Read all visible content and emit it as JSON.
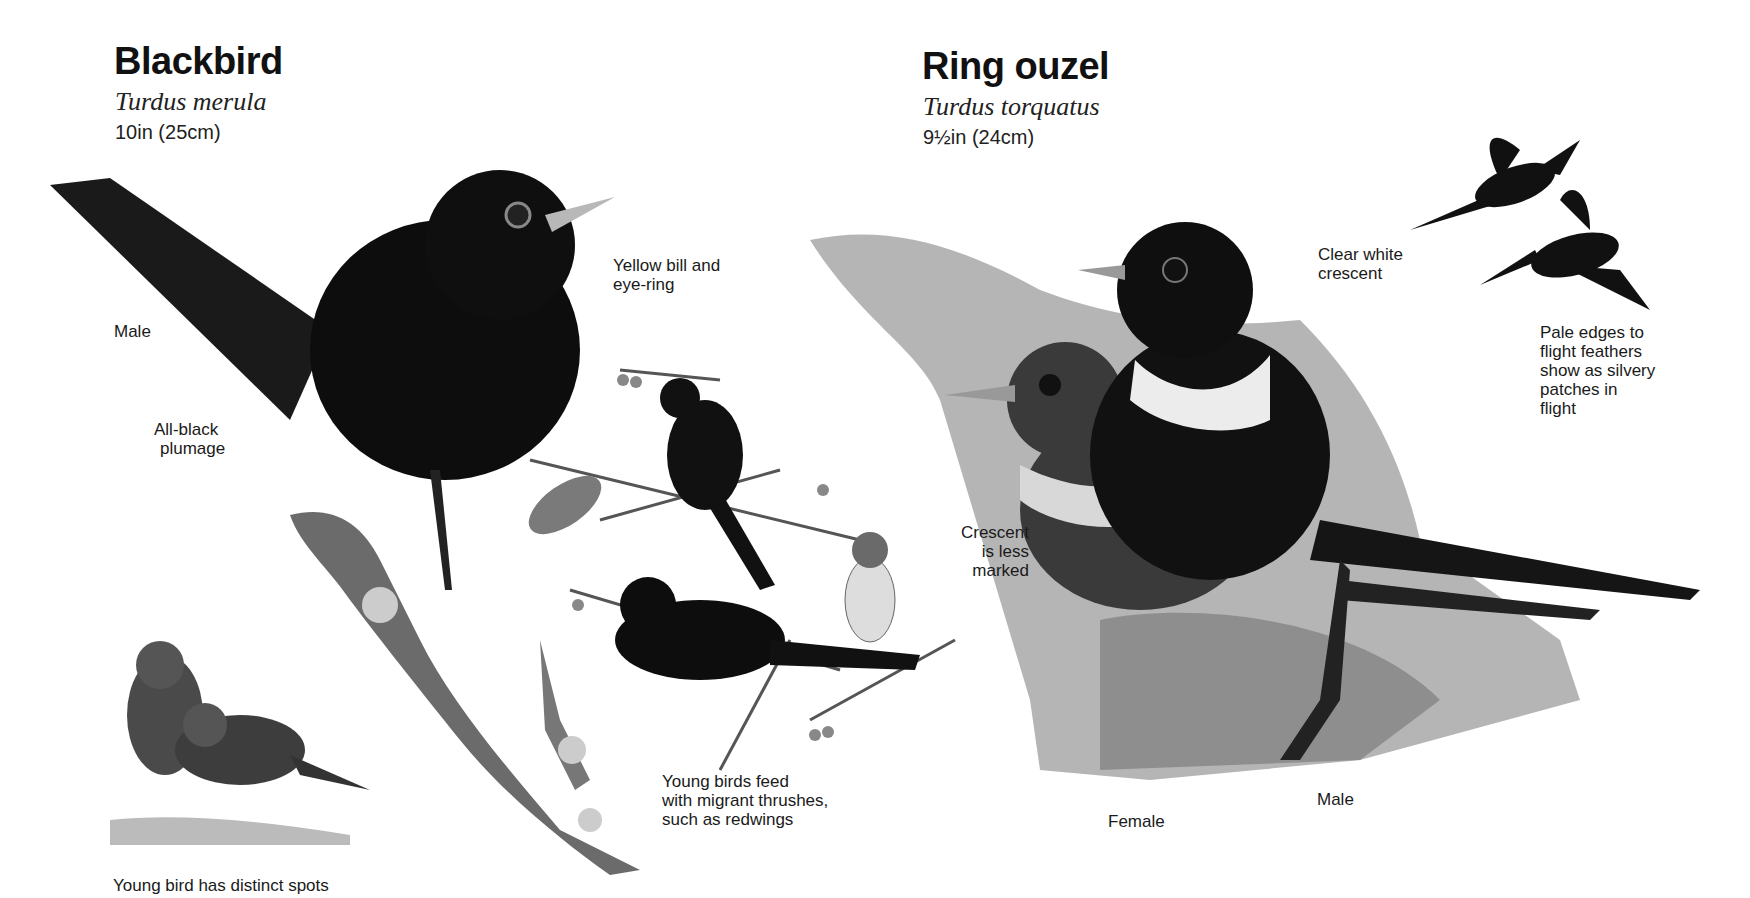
{
  "species": [
    {
      "name": "Blackbird",
      "latin": "Turdus merula",
      "size": "10in (25cm)",
      "labels": {
        "male": "Male",
        "plumage": [
          "All-black",
          "plumage"
        ],
        "bill": [
          "Yellow bill and",
          "eye-ring"
        ],
        "young_feed": [
          "Young birds feed",
          "with migrant thrushes,",
          "such as redwings"
        ],
        "young_spots": "Young bird has distinct spots"
      }
    },
    {
      "name": "Ring ouzel",
      "latin": "Turdus torquatus",
      "size": "9½in (24cm)",
      "labels": {
        "crescent_clear": [
          "Clear white",
          "crescent"
        ],
        "flight": [
          "Pale edges to",
          "flight feathers",
          "show as silvery",
          "patches in",
          "flight"
        ],
        "crescent_less": [
          "Crescent",
          "is less",
          "marked"
        ],
        "female": "Female",
        "male": "Male"
      }
    }
  ],
  "colors": {
    "ink": "#111111",
    "background": "#ffffff",
    "rock": "#9a9a9a"
  }
}
